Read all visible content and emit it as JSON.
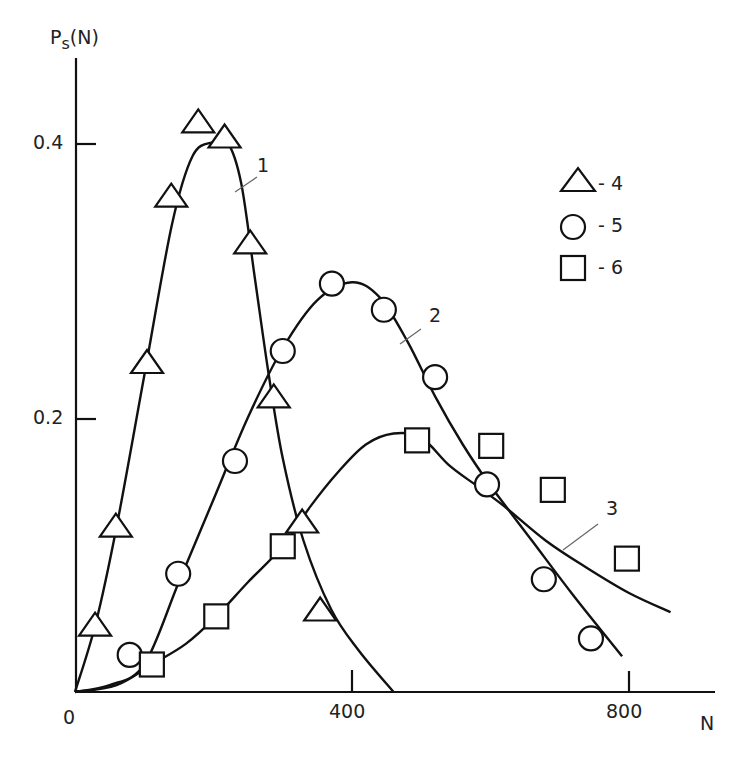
{
  "chart_data": {
    "type": "scatter",
    "title": "",
    "xlabel": "N",
    "ylabel": "Ps(N)",
    "xlim": [
      0,
      920
    ],
    "ylim": [
      0,
      0.46
    ],
    "x_ticks": [
      {
        "value": 0,
        "label": "0"
      },
      {
        "value": 400,
        "label": "400"
      },
      {
        "value": 800,
        "label": "800"
      }
    ],
    "y_ticks": [
      {
        "value": 0.2,
        "label": "0.2"
      },
      {
        "value": 0.4,
        "label": "0.4"
      }
    ],
    "grid": false,
    "legend": {
      "position": "upper right",
      "entries": [
        {
          "marker": "triangle",
          "label": "- 4"
        },
        {
          "marker": "circle",
          "label": "- 5"
        },
        {
          "marker": "square",
          "label": "- 6"
        }
      ]
    },
    "series": [
      {
        "name": "4",
        "marker": "triangle",
        "x": [
          29,
          59,
          104,
          139,
          178,
          216,
          253,
          287,
          328,
          354
        ],
        "y": [
          0.049,
          0.121,
          0.24,
          0.361,
          0.415,
          0.404,
          0.327,
          0.215,
          0.124,
          0.06
        ]
      },
      {
        "name": "5",
        "marker": "circle",
        "x": [
          79,
          149,
          231,
          300,
          371,
          446,
          520,
          595,
          677,
          745
        ],
        "y": [
          0.027,
          0.086,
          0.168,
          0.248,
          0.297,
          0.278,
          0.229,
          0.151,
          0.082,
          0.039
        ]
      },
      {
        "name": "6",
        "marker": "square",
        "x": [
          111,
          204,
          300,
          494,
          601,
          690,
          797
        ],
        "y": [
          0.02,
          0.055,
          0.106,
          0.183,
          0.179,
          0.147,
          0.097
        ]
      }
    ],
    "curves": [
      {
        "name": "1",
        "label": "1",
        "x": [
          0,
          30,
          60,
          100,
          140,
          170,
          200,
          220,
          240,
          260,
          280,
          300,
          330,
          370,
          410,
          460
        ],
        "y": [
          0,
          0.05,
          0.12,
          0.23,
          0.34,
          0.39,
          0.4,
          0.4,
          0.37,
          0.3,
          0.23,
          0.17,
          0.11,
          0.06,
          0.03,
          0
        ]
      },
      {
        "name": "2",
        "label": "2",
        "x": [
          0,
          50,
          100,
          150,
          200,
          250,
          300,
          350,
          400,
          440,
          480,
          520,
          560,
          600,
          660,
          720,
          790
        ],
        "y": [
          0,
          0.005,
          0.02,
          0.08,
          0.14,
          0.2,
          0.25,
          0.285,
          0.298,
          0.287,
          0.255,
          0.215,
          0.18,
          0.15,
          0.11,
          0.07,
          0.026
        ]
      },
      {
        "name": "3",
        "label": "3",
        "x": [
          0,
          60,
          111,
          160,
          204,
          250,
          300,
          340,
          380,
          420,
          460,
          500,
          540,
          580,
          620,
          680,
          740,
          800,
          860
        ],
        "y": [
          0,
          0.005,
          0.02,
          0.035,
          0.055,
          0.08,
          0.106,
          0.135,
          0.16,
          0.18,
          0.188,
          0.185,
          0.165,
          0.15,
          0.135,
          0.11,
          0.09,
          0.072,
          0.058
        ]
      }
    ]
  },
  "axes": {
    "y_title_main": "P",
    "y_title_sub": "s",
    "y_title_rest": "(N)",
    "x_title": "N",
    "x_tick_labels": [
      "0",
      "400",
      "800"
    ],
    "y_tick_labels": [
      "0.2",
      "0.4"
    ]
  },
  "curve_labels": [
    "1",
    "2",
    "3"
  ],
  "legend": [
    {
      "marker": "triangle",
      "label": "- 4"
    },
    {
      "marker": "circle",
      "label": "- 5"
    },
    {
      "marker": "square",
      "label": "- 6"
    }
  ]
}
